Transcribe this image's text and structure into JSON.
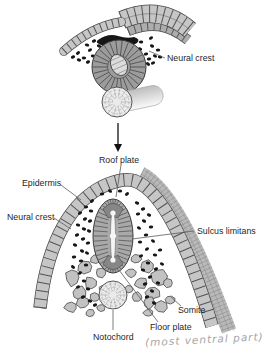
{
  "figure": {
    "colors": {
      "background": "#ffffff",
      "cell_fill": "#c6c6c6",
      "cell_outline": "#474747",
      "cut_band_fill": "#b9b9b9",
      "cut_band_line": "#7a7a7a",
      "neural_tube_fill": "#a9a9a9",
      "neural_tube_line": "#3a3a3a",
      "plate_fill": "#868686",
      "lumen_fill": "#f5f5f5",
      "crest_cell": "#171717",
      "notochord_fill": "#ebebeb",
      "notochord_line": "#9a9a9a",
      "somite_fill": "#c2c2c2",
      "leader_line": "#5a5a5a",
      "label_text": "#1f1f1f",
      "handwriting": "#a6a6a6",
      "arrow": "#111111"
    },
    "icons": {
      "transition_arrow": "down-arrow"
    },
    "top_panel": {
      "neural_crest_label": "Neural crest"
    },
    "bottom_panel": {
      "roof_plate_label": "Roof plate",
      "epidermis_label": "Epidermis",
      "neural_crest_label": "Neural crest",
      "sulcus_limitans_label": "Sulcus limitans",
      "somite_label": "Somite",
      "notochord_label": "Notochord",
      "floor_plate_label": "Floor plate",
      "handwritten_note": "(most ventral part)"
    }
  }
}
